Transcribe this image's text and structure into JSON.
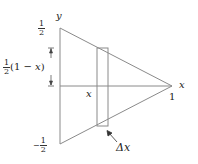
{
  "diagram": {
    "axes": {
      "y_label": "y",
      "x_label": "x",
      "y_top_tick": {
        "sign": "",
        "numerator": "1",
        "denominator": "2"
      },
      "y_bottom_tick": {
        "sign": "−",
        "numerator": "1",
        "denominator": "2"
      },
      "x_end_tick": "1"
    },
    "strip": {
      "position_label": "x",
      "width_label": "Δx"
    },
    "half_height_label": {
      "coeff_num": "1",
      "coeff_den": "2",
      "expr": "(1 − ",
      "var": "x",
      "close": ")"
    },
    "colors": {
      "line": "#8a8a8a",
      "text": "#222222"
    }
  }
}
